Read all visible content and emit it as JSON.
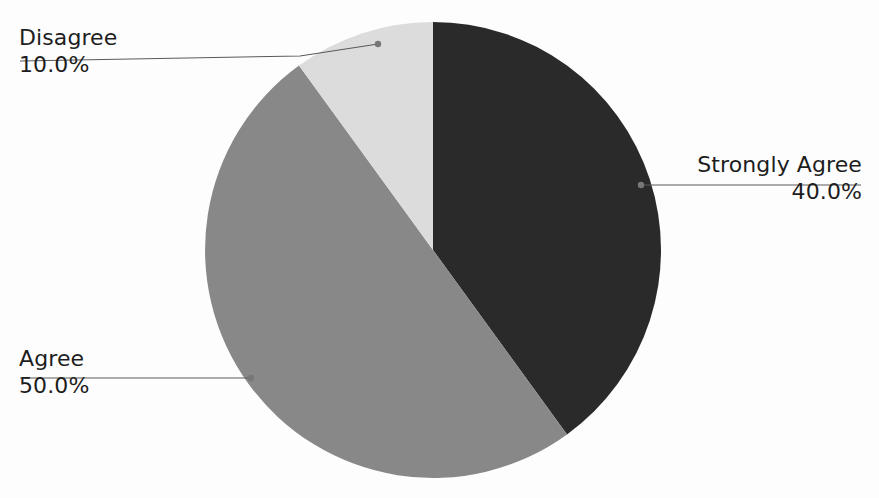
{
  "chart_data": {
    "type": "pie",
    "title": "",
    "subtitle": "",
    "xlabel": "",
    "ylabel": "",
    "legend_position": "none",
    "grid": false,
    "label_format": "name above, percent below, with leader line",
    "start_angle_deg": 0,
    "direction": "clockwise",
    "categories": [
      "Strongly Agree",
      "Agree",
      "Disagree"
    ],
    "values": [
      40.0,
      50.0,
      10.0
    ],
    "value_labels": [
      "40.0%",
      "50.0%",
      "10.0%"
    ],
    "colors": [
      "#2a2a2a",
      "#888888",
      "#dcdcdc"
    ],
    "slices": [
      {
        "name": "Strongly Agree",
        "value": 40.0,
        "value_label": "40.0%",
        "color": "#2a2a2a",
        "start_angle_deg": 0,
        "end_angle_deg": 144,
        "label_side": "right"
      },
      {
        "name": "Agree",
        "value": 50.0,
        "value_label": "50.0%",
        "color": "#888888",
        "start_angle_deg": 144,
        "end_angle_deg": 324,
        "label_side": "left"
      },
      {
        "name": "Disagree",
        "value": 10.0,
        "value_label": "10.0%",
        "color": "#dcdcdc",
        "start_angle_deg": 324,
        "end_angle_deg": 360,
        "label_side": "left"
      }
    ]
  },
  "figure": {
    "background_color": "#fdfdfd",
    "text_color": "#1d1d1d",
    "leader_color": "#5a5a5a",
    "center_x": 433,
    "center_y": 250,
    "radius": 228
  },
  "labels": {
    "disagree": {
      "name": "Disagree",
      "value": "10.0%"
    },
    "agree": {
      "name": "Agree",
      "value": "50.0%"
    },
    "strongly_agree": {
      "name": "Strongly Agree",
      "value": "40.0%"
    }
  }
}
